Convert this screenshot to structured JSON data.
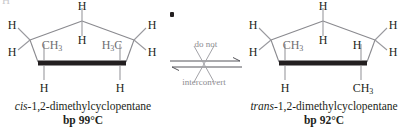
{
  "figure": {
    "kind": "stereochemistry-comparison",
    "top_left_artifact": "H",
    "center_dot": "•",
    "colors": {
      "ring_line": "#8a8a8f",
      "bold_bond": "#231f20",
      "substituent_line": "#9a9a9f",
      "label_dark": "#231f20",
      "label_gray": "#6e6e72",
      "note_gray": "#8c8c90",
      "background": "#ffffff"
    }
  },
  "arrow": {
    "note_top": "do not",
    "note_bottom": "interconvert",
    "type": "equilibrium-crossed-out",
    "crossed": true
  },
  "left_structure": {
    "name": "cis-1,2-dimethylcyclopentane",
    "prefix_italic": "cis",
    "name_rest": "-1,2-dimethylcyclopentane",
    "bp_label": "bp 99°C",
    "bp_value": 99,
    "bp_unit": "°C",
    "labels": {
      "top_up": "H",
      "top_down": "H",
      "left_upper": "H",
      "left_lower": "H",
      "right_upper": "H",
      "right_lower": "H",
      "front_left_interior": "CH3",
      "front_right_interior": "H3C",
      "front_left_below": "H",
      "front_right_below": "H"
    }
  },
  "right_structure": {
    "name": "trans-1,2-dimethylcyclopentane",
    "prefix_italic": "trans",
    "name_rest": "-1,2-dimethylcyclopentane",
    "bp_label": "bp 92°C",
    "bp_value": 92,
    "bp_unit": "°C",
    "labels": {
      "top_up": "H",
      "top_down": "H",
      "left_upper": "H",
      "left_lower": "H",
      "right_upper": "H",
      "right_lower": "H",
      "front_left_interior": "CH3",
      "front_right_interior": "H",
      "front_left_below": "H",
      "front_right_below": "CH3"
    }
  }
}
